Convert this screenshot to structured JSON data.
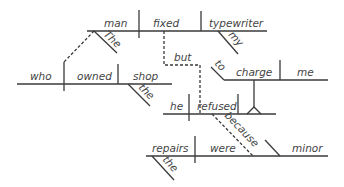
{
  "diagram": {
    "type": "sentence-diagram",
    "sentence": "The man who owned the shop fixed my typewriter but he refused to charge me because the repairs were minor",
    "colors": {
      "line": "#3a3a3a",
      "text": "#444444",
      "background": "#ffffff"
    },
    "main_clause": {
      "subject": "man",
      "verb": "fixed",
      "object": "typewriter",
      "modifiers": {
        "subject": "The",
        "object": "my"
      }
    },
    "relative_clause": {
      "subject": "who",
      "verb": "owned",
      "object": "shop",
      "modifiers": {
        "object": "the"
      }
    },
    "conjunction": "but",
    "second_clause": {
      "subject": "he",
      "verb": "refused"
    },
    "infinitive_phrase": {
      "marker": "to",
      "verb": "charge",
      "object": "me"
    },
    "subordinate_conjunction": "because",
    "adverbial_clause": {
      "subject": "repairs",
      "verb": "were",
      "complement": "minor",
      "modifiers": {
        "subject": "the"
      }
    }
  }
}
